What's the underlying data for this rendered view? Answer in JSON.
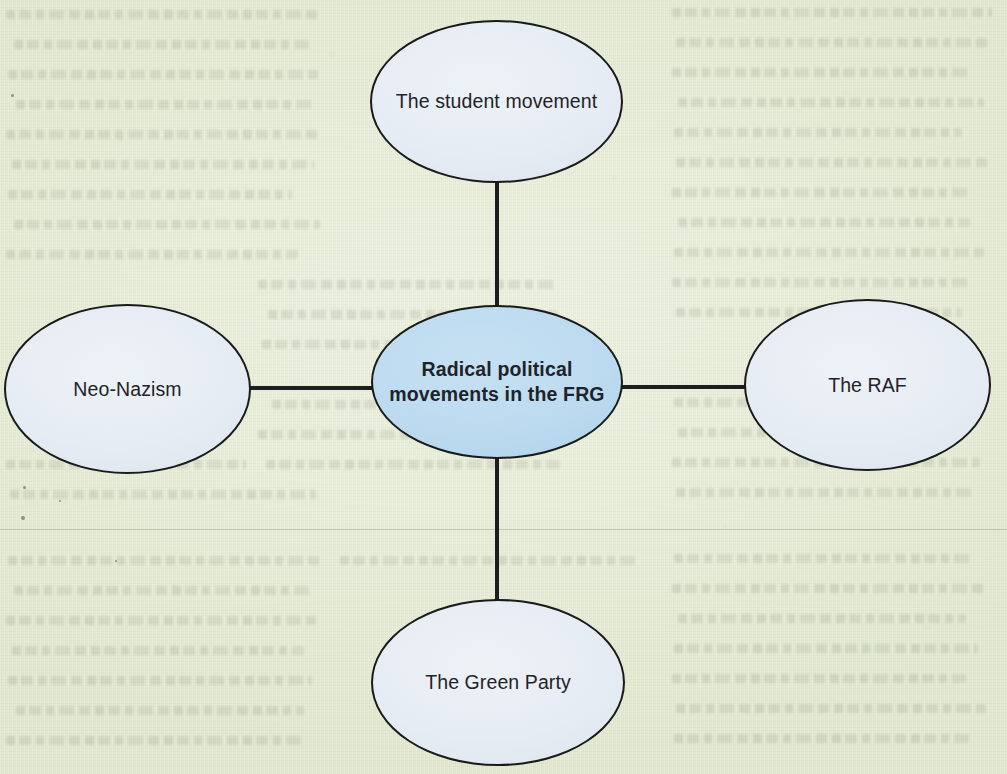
{
  "document": {
    "type": "mind-map",
    "page_background_color": "#e6ecd8",
    "scan_artifacts": {
      "seam_line_color": "#686f5e",
      "bleed_through_text": "illegible reverse-side text"
    }
  },
  "mindmap": {
    "title": "Radical political movements in the FRG",
    "center": {
      "id": "center",
      "label": "Radical political movements in the FRG",
      "shape": "ellipse",
      "fill_color": "#bfdcf0",
      "border_color": "#1a1a1a",
      "font_weight": "bold"
    },
    "branches": [
      {
        "id": "student-movement",
        "label": "The student movement",
        "position": "top",
        "shape": "ellipse",
        "fill_color": "#e8eef4",
        "border_color": "#1a1a1a",
        "font_weight": "regular"
      },
      {
        "id": "neo-nazism",
        "label": "Neo-Nazism",
        "position": "left",
        "shape": "ellipse",
        "fill_color": "#e8eef4",
        "border_color": "#1a1a1a",
        "font_weight": "regular"
      },
      {
        "id": "raf",
        "label": "The RAF",
        "position": "right",
        "shape": "ellipse",
        "fill_color": "#e8eef4",
        "border_color": "#1a1a1a",
        "font_weight": "regular"
      },
      {
        "id": "green-party",
        "label": "The Green Party",
        "position": "bottom",
        "shape": "ellipse",
        "fill_color": "#e8eef4",
        "border_color": "#1a1a1a",
        "font_weight": "regular"
      }
    ],
    "connectors": [
      {
        "id": "center-to-student-movement",
        "orientation": "vertical",
        "from": "center",
        "to": "student-movement",
        "color": "#1d1d1d"
      },
      {
        "id": "center-to-green-party",
        "orientation": "vertical",
        "from": "center",
        "to": "green-party",
        "color": "#1d1d1d"
      },
      {
        "id": "center-to-neo-nazism",
        "orientation": "horizontal",
        "from": "center",
        "to": "neo-nazism",
        "color": "#1d1d1d"
      },
      {
        "id": "center-to-raf",
        "orientation": "horizontal",
        "from": "center",
        "to": "raf",
        "color": "#1d1d1d"
      }
    ]
  }
}
